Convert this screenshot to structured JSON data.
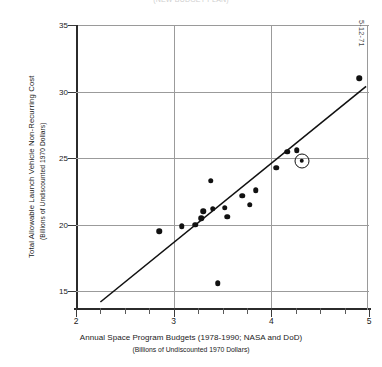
{
  "figure": {
    "top_title_partial": "(NEW BUDGET PLAN)",
    "date_stamp": "5-12-71"
  },
  "chart_data": {
    "type": "scatter",
    "title": "",
    "xlabel": "Annual Space Program Budgets (1978-1990; NASA and DoD)",
    "xlabel_sub": "(Billions of Undiscounted 1970 Dollars)",
    "ylabel": "Total Allowable Launch Vehicle Non-Recurring Cost",
    "ylabel_sub": "(Billions of Undiscounted 1970 Dollars)",
    "xlim": [
      2,
      5
    ],
    "ylim": [
      13.6,
      35
    ],
    "xticks": [
      2,
      3,
      4,
      5
    ],
    "xtick_labels": [
      "2",
      "3",
      "4",
      "5"
    ],
    "x_minor_ticks": [
      2.25,
      2.5,
      2.75,
      3.25,
      3.5,
      3.75,
      4.25,
      4.5,
      4.75
    ],
    "yticks": [
      15,
      20,
      25,
      30,
      35
    ],
    "ytick_labels": [
      "15",
      "20",
      "25",
      "30",
      "35"
    ],
    "grid": true,
    "legend": "none",
    "points": [
      {
        "x": 2.85,
        "y": 19.5,
        "highlighted": false
      },
      {
        "x": 3.08,
        "y": 19.9,
        "highlighted": false
      },
      {
        "x": 3.22,
        "y": 20.0,
        "highlighted": false
      },
      {
        "x": 3.28,
        "y": 20.5,
        "highlighted": false
      },
      {
        "x": 3.3,
        "y": 21.0,
        "highlighted": false
      },
      {
        "x": 3.4,
        "y": 21.2,
        "highlighted": false
      },
      {
        "x": 3.38,
        "y": 23.3,
        "highlighted": false
      },
      {
        "x": 3.45,
        "y": 15.6,
        "highlighted": false
      },
      {
        "x": 3.52,
        "y": 21.3,
        "highlighted": false
      },
      {
        "x": 3.55,
        "y": 20.6,
        "highlighted": false
      },
      {
        "x": 3.7,
        "y": 22.2,
        "highlighted": false
      },
      {
        "x": 3.78,
        "y": 21.5,
        "highlighted": false
      },
      {
        "x": 3.84,
        "y": 22.6,
        "highlighted": false
      },
      {
        "x": 4.05,
        "y": 24.3,
        "highlighted": false
      },
      {
        "x": 4.16,
        "y": 25.5,
        "highlighted": false
      },
      {
        "x": 4.26,
        "y": 25.6,
        "highlighted": false
      },
      {
        "x": 4.31,
        "y": 24.8,
        "highlighted": true
      },
      {
        "x": 4.9,
        "y": 31.0,
        "highlighted": false
      }
    ],
    "fit_line": {
      "x0": 2.25,
      "y0": 14.2,
      "x1": 4.97,
      "y1": 30.4
    }
  }
}
